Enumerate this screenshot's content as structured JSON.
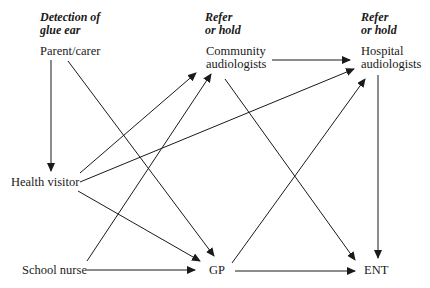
{
  "headers": [
    {
      "line1": "Detection of",
      "line2": "glue ear"
    },
    {
      "line1": "Refer",
      "line2": "or hold"
    },
    {
      "line1": "Refer",
      "line2": "or hold"
    }
  ],
  "nodes": {
    "parent_carer": "Parent/carer",
    "community_audiologists": {
      "line1": "Community",
      "line2": "audiologists"
    },
    "hospital_audiologists": {
      "line1": "Hospital",
      "line2": "audiologists"
    },
    "health_visitor": "Health visitor",
    "school_nurse": "School nurse",
    "gp": "GP",
    "ent": "ENT"
  },
  "edges": [
    {
      "from": "Parent/carer",
      "to": "Health visitor"
    },
    {
      "from": "Parent/carer",
      "to": "GP"
    },
    {
      "from": "Community audiologists",
      "to": "Hospital audiologists"
    },
    {
      "from": "Community audiologists",
      "to": "ENT"
    },
    {
      "from": "Health visitor",
      "to": "Community audiologists"
    },
    {
      "from": "Health visitor",
      "to": "Hospital audiologists"
    },
    {
      "from": "Health visitor",
      "to": "GP"
    },
    {
      "from": "School nurse",
      "to": "Community audiologists"
    },
    {
      "from": "School nurse",
      "to": "GP"
    },
    {
      "from": "GP",
      "to": "Hospital audiologists"
    },
    {
      "from": "GP",
      "to": "ENT"
    },
    {
      "from": "Hospital audiologists",
      "to": "ENT"
    }
  ],
  "colors": {
    "line": "#1a1a1a",
    "background": "#ffffff"
  }
}
